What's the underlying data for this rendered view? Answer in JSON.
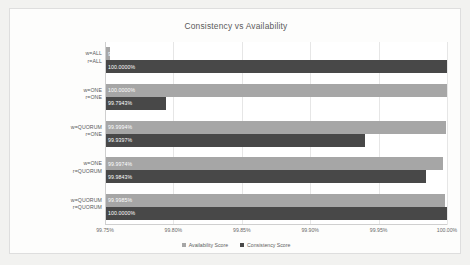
{
  "chart_data": {
    "type": "bar",
    "orientation": "horizontal",
    "title": "Consistency vs Availability",
    "xlabel": "",
    "ylabel": "",
    "xlim": [
      99.75,
      100.0
    ],
    "xticks": [
      "99.75%",
      "99.80%",
      "99.85%",
      "99.90%",
      "99.95%",
      "100.00%"
    ],
    "xtick_values": [
      99.75,
      99.8,
      99.85,
      99.9,
      99.95,
      100.0
    ],
    "grid": true,
    "legend_position": "bottom",
    "categories": [
      {
        "line1": "w=ALL",
        "line2": "r=ALL"
      },
      {
        "line1": "w=ONE",
        "line2": "r=ONE"
      },
      {
        "line1": "w=QUORUM",
        "line2": "r=ONE"
      },
      {
        "line1": "w=ONE",
        "line2": "r=QUORUM"
      },
      {
        "line1": "w=QUORUM",
        "line2": "r=QUORUM"
      }
    ],
    "series": [
      {
        "name": "Availability Score",
        "color": "#a6a6a6",
        "values": [
          99.7539,
          100.0,
          99.9994,
          99.9974,
          99.9985
        ],
        "labels": [
          "99.7539%",
          "100.0000%",
          "99.9994%",
          "99.9974%",
          "99.9985%"
        ]
      },
      {
        "name": "Consistency Score",
        "color": "#484848",
        "values": [
          100.0,
          99.7943,
          99.9397,
          99.9843,
          100.0
        ],
        "labels": [
          "100.0000%",
          "99.7943%",
          "99.9397%",
          "99.9843%",
          "100.0000%"
        ]
      }
    ]
  }
}
